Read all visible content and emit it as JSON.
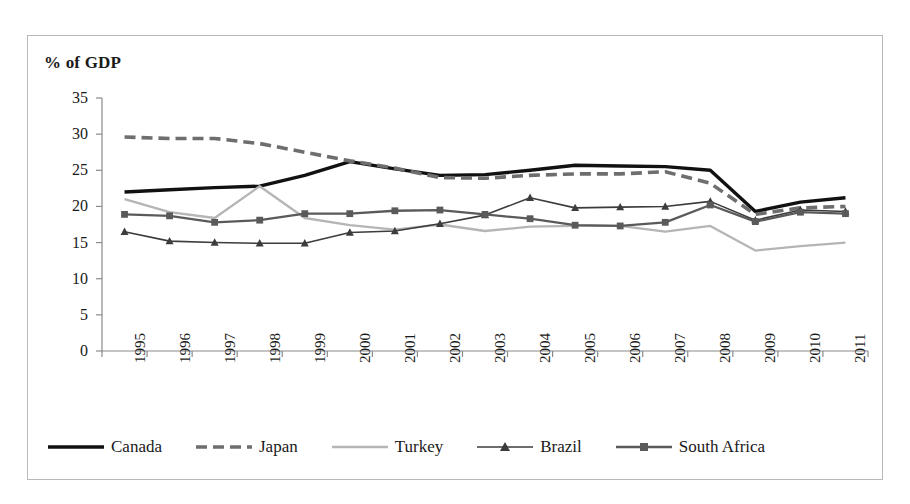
{
  "chart_data": {
    "type": "line",
    "title": "% of GDP",
    "xlabel": "",
    "ylabel": "",
    "ylim": [
      0,
      35
    ],
    "ytick_step": 5,
    "yticks": [
      0,
      5,
      10,
      15,
      20,
      25,
      30,
      35
    ],
    "grid": false,
    "legend_position": "bottom",
    "categories": [
      "1995",
      "1996",
      "1997",
      "1998",
      "1999",
      "2000",
      "2001",
      "2002",
      "2003",
      "2004",
      "2005",
      "2006",
      "2007",
      "2008",
      "2009",
      "2010",
      "2011"
    ],
    "series": [
      {
        "name": "Canada",
        "color": "#111111",
        "style": "solid-thick",
        "marker": "none",
        "values": [
          22.0,
          22.3,
          22.6,
          22.8,
          24.3,
          26.2,
          25.2,
          24.3,
          24.4,
          25.0,
          25.7,
          25.6,
          25.5,
          25.0,
          19.3,
          20.6,
          21.2
        ]
      },
      {
        "name": "Japan",
        "color": "#6e6e6e",
        "style": "dashed-thick",
        "marker": "none",
        "values": [
          29.6,
          29.4,
          29.4,
          28.7,
          27.5,
          26.3,
          25.3,
          24.0,
          23.9,
          24.3,
          24.5,
          24.5,
          24.8,
          23.2,
          18.9,
          19.8,
          20.0
        ]
      },
      {
        "name": "Turkey",
        "color": "#b5b5b5",
        "style": "solid-medium",
        "marker": "none",
        "values": [
          21.0,
          19.2,
          18.4,
          22.8,
          18.4,
          17.4,
          16.8,
          17.5,
          16.6,
          17.2,
          17.3,
          17.3,
          16.5,
          17.3,
          13.9,
          14.5,
          15.0
        ]
      },
      {
        "name": "Brazil",
        "color": "#3c3c3c",
        "style": "solid-thin",
        "marker": "triangle",
        "values": [
          16.5,
          15.2,
          15.0,
          14.9,
          14.9,
          16.4,
          16.6,
          17.6,
          18.8,
          21.2,
          19.8,
          19.9,
          20.0,
          20.7,
          18.1,
          19.5,
          19.3
        ]
      },
      {
        "name": "South Africa",
        "color": "#5a5a5a",
        "style": "solid-medium",
        "marker": "square",
        "values": [
          18.9,
          18.7,
          17.8,
          18.1,
          19.0,
          19.0,
          19.4,
          19.5,
          18.9,
          18.3,
          17.4,
          17.3,
          17.8,
          20.2,
          17.9,
          19.2,
          19.0
        ]
      }
    ]
  },
  "legend": {
    "items": [
      {
        "label": "Canada"
      },
      {
        "label": "Japan"
      },
      {
        "label": "Turkey"
      },
      {
        "label": "Brazil"
      },
      {
        "label": "South Africa"
      }
    ]
  }
}
